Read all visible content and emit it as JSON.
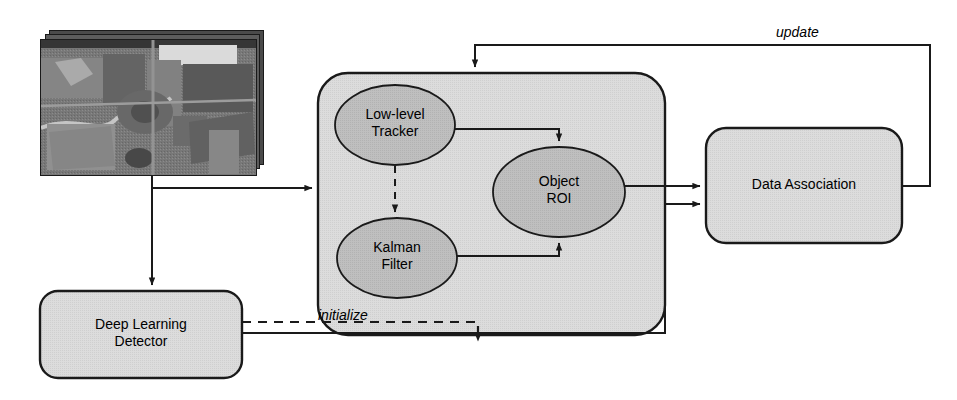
{
  "diagram": {
    "background_color": "#ffffff",
    "stroke_color": "#1a1a1a",
    "node_fill_box": "#d6d6d6",
    "node_fill_ellipse": "#b8b8b8",
    "text_color": "#000000"
  },
  "nodes": {
    "image_stack": {
      "name": "input-image-sequence",
      "label": "",
      "shape": "image-stack",
      "x": 40,
      "y": 30,
      "width": 225,
      "height": 145,
      "sheets": 3
    },
    "tracker_container": {
      "name": "tracking-module",
      "label": "",
      "shape": "rounded-rect",
      "x": 318,
      "y": 73,
      "width": 347,
      "height": 262
    },
    "low_level_tracker": {
      "name": "low-level-tracker",
      "label": "Low-level\nTracker",
      "shape": "ellipse",
      "cx": 395,
      "cy": 125,
      "rx": 60,
      "ry": 40
    },
    "kalman_filter": {
      "name": "kalman-filter",
      "label": "Kalman\nFilter",
      "shape": "ellipse",
      "cx": 397,
      "cy": 258,
      "rx": 60,
      "ry": 40
    },
    "object_roi": {
      "name": "object-roi",
      "label": "Object\nROI",
      "shape": "ellipse",
      "cx": 559,
      "cy": 192,
      "rx": 66,
      "ry": 45
    },
    "data_association": {
      "name": "data-association",
      "label": "Data Association",
      "shape": "rounded-rect",
      "x": 706,
      "y": 128,
      "width": 196,
      "height": 115
    },
    "deep_learning_detector": {
      "name": "deep-learning-detector",
      "label": "Deep Learning\nDetector",
      "shape": "rounded-rect",
      "x": 40,
      "y": 291,
      "width": 202,
      "height": 87
    }
  },
  "edges": [
    {
      "name": "edge-images-to-tracker",
      "from": "image_stack",
      "to": "tracker_container",
      "style": "solid",
      "label": ""
    },
    {
      "name": "edge-images-to-detector",
      "from": "image_stack",
      "to": "deep_learning_detector",
      "style": "solid",
      "label": ""
    },
    {
      "name": "edge-tracker-to-roi",
      "from": "low_level_tracker",
      "to": "object_roi",
      "style": "solid",
      "label": ""
    },
    {
      "name": "edge-tracker-to-kalman",
      "from": "low_level_tracker",
      "to": "kalman_filter",
      "style": "dashed",
      "label": ""
    },
    {
      "name": "edge-kalman-to-roi",
      "from": "kalman_filter",
      "to": "object_roi",
      "style": "solid",
      "label": ""
    },
    {
      "name": "edge-roi-to-data-association",
      "from": "object_roi",
      "to": "data_association",
      "style": "solid",
      "label": ""
    },
    {
      "name": "edge-detector-to-data-association",
      "from": "deep_learning_detector",
      "to": "data_association",
      "style": "solid",
      "label": ""
    },
    {
      "name": "edge-detector-initialize-tracker",
      "from": "deep_learning_detector",
      "to": "tracker_container",
      "style": "dashed",
      "label": "initialize"
    },
    {
      "name": "edge-data-association-update-tracker",
      "from": "data_association",
      "to": "tracker_container",
      "style": "solid",
      "label": "update"
    }
  ],
  "edge_labels": {
    "update": "update",
    "initialize": "initialize"
  }
}
